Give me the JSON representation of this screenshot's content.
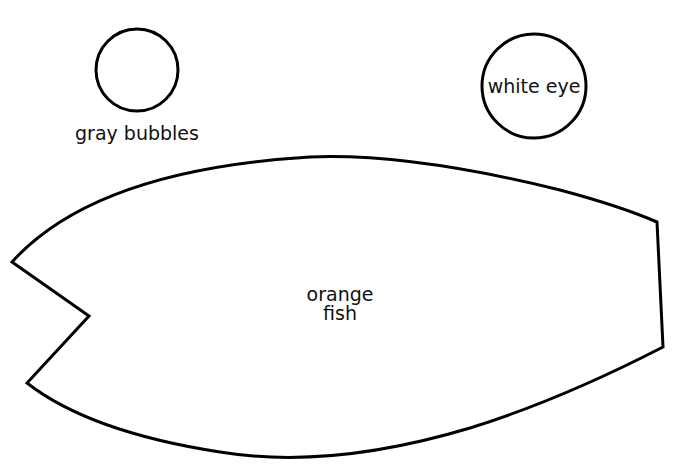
{
  "shapes": {
    "bubble": {
      "label": "gray bubbles",
      "cx": 137,
      "cy": 70,
      "r": 41
    },
    "eye": {
      "label": "white eye",
      "cx": 534,
      "cy": 86,
      "r": 52
    },
    "fish": {
      "label_line1": "orange",
      "label_line2": "fish"
    }
  },
  "colors": {
    "stroke": "#000000",
    "fill": "#ffffff"
  }
}
